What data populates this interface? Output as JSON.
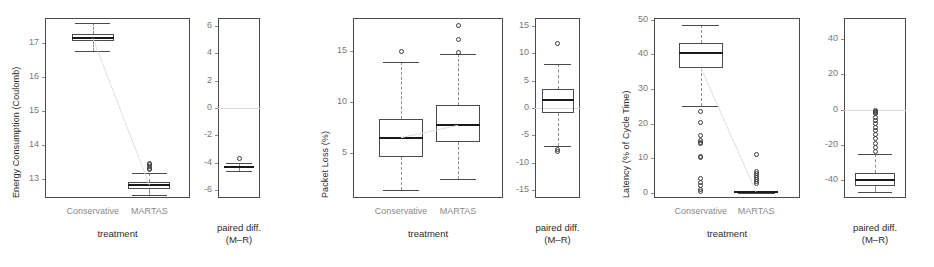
{
  "figure": {
    "background": "#ffffff",
    "box_color": "#4a4a4a",
    "median_color": "#1a1a1a",
    "whisker_color": "#8d8d8d",
    "tick_color": "#777777",
    "category_label_color": "#8a8a8a",
    "connector_color": "#dedede"
  },
  "common": {
    "x_axis_title": "treatment",
    "categories": [
      "Conservative",
      "MARTAS"
    ],
    "paired_caption_line1": "paired diff.",
    "paired_caption_line2": "(M–R)"
  },
  "chart_data": [
    {
      "type": "box",
      "panel": "energy-treatment",
      "title": "",
      "ylabel": "Energy Consumption (Coulomb)",
      "xlabel": "treatment",
      "ylim": [
        12.45,
        17.75
      ],
      "yticks": [
        13,
        14,
        15,
        16,
        17
      ],
      "ytick_labels": [
        "13",
        "14",
        "15",
        "16",
        "17"
      ],
      "grid": false,
      "categories": [
        "Conservative",
        "MARTAS"
      ],
      "boxes": [
        {
          "name": "Conservative",
          "q1": 17.08,
          "median": 17.15,
          "q3": 17.27,
          "whisker_low": 16.78,
          "whisker_high": 17.6,
          "mean": 17.17,
          "outliers": []
        },
        {
          "name": "MARTAS",
          "q1": 12.72,
          "median": 12.83,
          "q3": 12.92,
          "whisker_low": 12.55,
          "whisker_high": 13.2,
          "mean": 12.84,
          "outliers": [
            13.28,
            13.33,
            13.38,
            13.44,
            13.48
          ]
        }
      ],
      "connector": {
        "from": 17.15,
        "to": 12.83
      }
    },
    {
      "type": "box",
      "panel": "energy-paired-diff",
      "title": "",
      "ylabel": "",
      "xlabel": "paired diff. (M–R)",
      "ylim": [
        -6.6,
        6.6
      ],
      "yticks": [
        -6,
        -4,
        -2,
        0,
        2,
        4,
        6
      ],
      "ytick_labels": [
        "-6",
        "-4",
        "-2",
        "0",
        "2",
        "4",
        "6"
      ],
      "grid": false,
      "zero_reference": 0,
      "boxes": [
        {
          "name": "paired diff.",
          "q1": -4.38,
          "median": -4.3,
          "q3": -4.22,
          "whisker_low": -4.62,
          "whisker_high": -4.05,
          "mean": -4.3,
          "outliers": [
            -3.72
          ]
        }
      ]
    },
    {
      "type": "box",
      "panel": "packet-loss-treatment",
      "title": "",
      "ylabel": "Packet Loss (%)",
      "xlabel": "treatment",
      "ylim": [
        0.6,
        18.2
      ],
      "yticks": [
        5,
        10,
        15
      ],
      "ytick_labels": [
        "5",
        "10",
        "15"
      ],
      "grid": false,
      "categories": [
        "Conservative",
        "MARTAS"
      ],
      "boxes": [
        {
          "name": "Conservative",
          "q1": 4.6,
          "median": 6.5,
          "q3": 8.3,
          "whisker_low": 1.4,
          "whisker_high": 13.9,
          "mean": 6.6,
          "outliers": [
            14.9
          ]
        },
        {
          "name": "MARTAS",
          "q1": 6.1,
          "median": 7.7,
          "q3": 9.7,
          "whisker_low": 2.5,
          "whisker_high": 14.7,
          "mean": 7.8,
          "outliers": [
            14.85,
            16.1,
            17.5
          ]
        }
      ],
      "connector": {
        "from": 6.5,
        "to": 7.7
      }
    },
    {
      "type": "box",
      "panel": "packet-loss-paired-diff",
      "title": "",
      "ylabel": "",
      "xlabel": "paired diff. (M–R)",
      "ylim": [
        -16.5,
        16.5
      ],
      "yticks": [
        -15,
        -10,
        -5,
        0,
        5,
        10,
        15
      ],
      "ytick_labels": [
        "-15",
        "-10",
        "-5",
        "0",
        "5",
        "10",
        "15"
      ],
      "grid": false,
      "zero_reference": 0,
      "boxes": [
        {
          "name": "paired diff.",
          "q1": -0.9,
          "median": 1.4,
          "q3": 3.5,
          "whisker_low": -7.0,
          "whisker_high": 8.0,
          "mean": 1.3,
          "outliers": [
            11.9,
            -7.6,
            -8.0
          ]
        }
      ]
    },
    {
      "type": "box",
      "panel": "latency-treatment",
      "title": "",
      "ylabel": "Latency (% of Cycle Time)",
      "xlabel": "treatment",
      "ylim": [
        -1.5,
        50.5
      ],
      "yticks": [
        0,
        10,
        20,
        30,
        40,
        50
      ],
      "ytick_labels": [
        "0",
        "10",
        "20",
        "30",
        "40",
        "50"
      ],
      "grid": false,
      "categories": [
        "Conservative",
        "MARTAS"
      ],
      "boxes": [
        {
          "name": "Conservative",
          "q1": 36.0,
          "median": 40.3,
          "q3": 43.2,
          "whisker_low": 25.0,
          "whisker_high": 48.4,
          "mean": 36.2,
          "outliers": [
            23.5,
            20.2,
            16.7,
            15.2,
            14.6,
            14.2,
            10.6,
            10.3,
            4.2,
            3.0,
            2.0,
            1.0,
            0.4
          ]
        },
        {
          "name": "MARTAS",
          "q1": 0.0,
          "median": 0.2,
          "q3": 0.4,
          "whisker_low": 0.0,
          "whisker_high": 0.6,
          "mean": 0.2,
          "outliers": [
            11.0,
            6.2,
            5.6,
            5.0,
            4.4,
            3.8,
            3.2,
            2.6
          ]
        }
      ],
      "connector": {
        "from": 36.2,
        "to": 0.2
      }
    },
    {
      "type": "box",
      "panel": "latency-paired-diff",
      "title": "",
      "ylabel": "",
      "xlabel": "paired diff. (M–R)",
      "ylim": [
        -50,
        52
      ],
      "yticks": [
        -40,
        -20,
        0,
        20,
        40
      ],
      "ytick_labels": [
        "-40",
        "-20",
        "0",
        "20",
        "40"
      ],
      "grid": false,
      "zero_reference": 0,
      "boxes": [
        {
          "name": "paired diff.",
          "q1": -43.0,
          "median": -39.6,
          "q3": -36.0,
          "whisker_low": -46.5,
          "whisker_high": -25.2,
          "mean": -39.0,
          "outliers": [
            -0.5,
            -1.0,
            -1.6,
            -2.2,
            -4.2,
            -6.0,
            -8.0,
            -10.0,
            -12.0,
            -14.0,
            -16.5,
            -19.0,
            -21.5,
            -23.5
          ]
        }
      ]
    }
  ]
}
